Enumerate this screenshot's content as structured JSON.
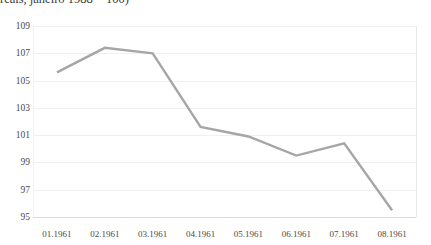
{
  "chart_title_fragment": "reais, janeiro 1988 = 100)",
  "axes": {
    "y_ticks": [
      "109",
      "107",
      "105",
      "103",
      "101",
      "99",
      "97",
      "95"
    ],
    "x_ticks": [
      "01.1961",
      "02.1961",
      "03.1961",
      "04.1961",
      "05.1961",
      "06.1961",
      "07.1961",
      "08.1961"
    ]
  },
  "style": {
    "line_color": "#a6a6a6",
    "grid_color": "#f0f0f0",
    "axis_color": "#d9d9d9",
    "text_color": "#4a4a4a"
  },
  "chart_data": {
    "type": "line",
    "title": "reais, janeiro 1988 = 100)",
    "xlabel": "",
    "ylabel": "",
    "categories": [
      "01.1961",
      "02.1961",
      "03.1961",
      "04.1961",
      "05.1961",
      "06.1961",
      "07.1961",
      "08.1961"
    ],
    "values": [
      105.6,
      107.4,
      107.0,
      101.6,
      100.9,
      99.5,
      100.4,
      95.5
    ],
    "ylim": [
      95,
      109
    ],
    "ytick_step": 2,
    "grid": true,
    "legend": false,
    "markers": false,
    "line_color": "#a6a6a6",
    "line_width": 2.4
  }
}
